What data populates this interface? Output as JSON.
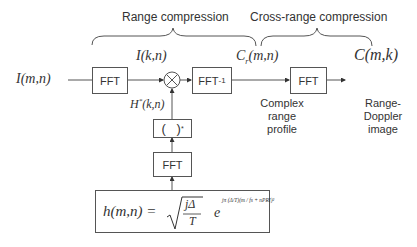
{
  "diagram": {
    "sections": {
      "range_compression": "Range compression",
      "cross_range_compression": "Cross-range compression"
    },
    "signals": {
      "input": "I(m,n)",
      "after_fft": "I(k,n)",
      "filter": "H*(k,n)",
      "complex_range_profile_signal": "Cr(m,n)",
      "output": "C(m,k)"
    },
    "signal_parts": {
      "input_main": "I(m,n)",
      "after_fft_main": "I(k,n)",
      "filter_main": "H",
      "filter_sup": "*",
      "filter_args": "(k,n)",
      "cr_main": "C",
      "cr_sub": "r",
      "cr_args": "(m,n)",
      "output_main": "C(m,k)"
    },
    "blocks": {
      "fft_input": "FFT",
      "multiply": "⊗",
      "ifft_main": "FFT",
      "ifft_sup": "-1",
      "fft_cross_range": "FFT",
      "conjugate": "(   )",
      "conjugate_sup": "*",
      "fft_reference": "FFT"
    },
    "annotations": {
      "complex_range_profile": [
        "Complex",
        "range",
        "profile"
      ],
      "range_doppler_image": [
        "Range-",
        "Doppler",
        "image"
      ]
    },
    "reference_function": {
      "lhs": "h(m,n) =",
      "sqrt_numerator": "jΔ",
      "sqrt_denominator": "T",
      "exp_base": "e",
      "exponent": "jπ (Δ/T)(m / fs + nPRI)²"
    },
    "colors": {
      "line": "#555555",
      "text": "#333333",
      "background": "#ffffff"
    }
  }
}
